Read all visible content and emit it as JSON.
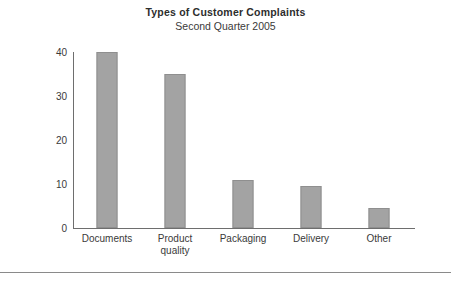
{
  "chart_data": {
    "type": "bar",
    "title": "Types of Customer Complaints",
    "subtitle": "Second Quarter 2005",
    "xlabel": "",
    "ylabel": "",
    "ylim": [
      0,
      40
    ],
    "yticks": [
      0,
      10,
      20,
      30,
      40
    ],
    "grid": false,
    "legend": "none",
    "categories": [
      "Documents",
      "Product\nquality",
      "Packaging",
      "Delivery",
      "Other"
    ],
    "values": [
      40,
      35,
      11,
      9.5,
      4.5
    ],
    "bar_color": "#a3a3a3",
    "bar_edge_color": "#8f8f8f",
    "axis_color": "#6e6e6e",
    "text_color": "#3a3a3a"
  }
}
